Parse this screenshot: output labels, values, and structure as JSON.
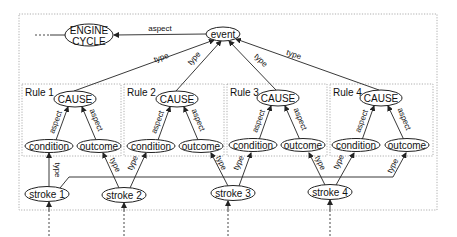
{
  "diagram": {
    "nodes": {
      "engine_cycle": {
        "line1": "ENGINE",
        "line2": "CYCLE"
      },
      "event": "event",
      "rules": [
        {
          "title": "Rule 1",
          "cause": "CAUSE",
          "condition": "condition",
          "outcome": "outcome"
        },
        {
          "title": "Rule 2",
          "cause": "CAUSE",
          "condition": "condition",
          "outcome": "outcome"
        },
        {
          "title": "Rule 3",
          "cause": "CAUSE",
          "condition": "condition",
          "outcome": "outcome"
        },
        {
          "title": "Rule 4",
          "cause": "CAUSE",
          "condition": "condition",
          "outcome": "outcome"
        }
      ],
      "strokes": [
        "stroke 1",
        "stroke 2",
        "stroke 3",
        "stroke 4"
      ]
    },
    "edge_labels": {
      "aspect": "aspect",
      "type": "type"
    },
    "colors": {
      "line": "#222222",
      "dotted_border": "#999999",
      "background": "#ffffff"
    }
  }
}
